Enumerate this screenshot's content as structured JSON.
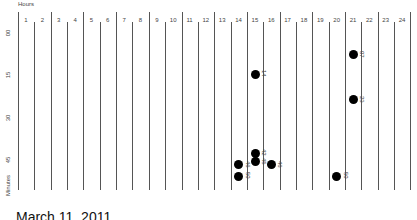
{
  "chart_data": {
    "type": "scatter",
    "title": "",
    "xlabel": "Hours",
    "ylabel": "Minutes",
    "x_ticks": [
      "1",
      "2",
      "3",
      "4",
      "5",
      "6",
      "7",
      "8",
      "9",
      "10",
      "11",
      "12",
      "13",
      "14",
      "15",
      "16",
      "17",
      "18",
      "19",
      "20",
      "21",
      "22",
      "23",
      "24"
    ],
    "y_ticks": [
      "00",
      "15",
      "30",
      "45"
    ],
    "ylim": [
      0,
      60
    ],
    "points": [
      {
        "hour": 21,
        "minute": 7,
        "label": "07"
      },
      {
        "hour": 15,
        "minute": 14,
        "label": "14"
      },
      {
        "hour": 21,
        "minute": 23,
        "label": "23"
      },
      {
        "hour": 15,
        "minute": 42,
        "label": "42"
      },
      {
        "hour": 15,
        "minute": 45,
        "label": "45"
      },
      {
        "hour": 16,
        "minute": 46,
        "label": "46"
      },
      {
        "hour": 14,
        "minute": 46,
        "label": "46"
      },
      {
        "hour": 14,
        "minute": 50,
        "label": "50"
      },
      {
        "hour": 20,
        "minute": 50,
        "label": "50"
      }
    ],
    "grid": "vertical lines per hour",
    "footer": "March 11, 2011"
  },
  "labels": {
    "hours": "Hours",
    "minutes": "Minutes",
    "date": "March 11, 2011"
  }
}
